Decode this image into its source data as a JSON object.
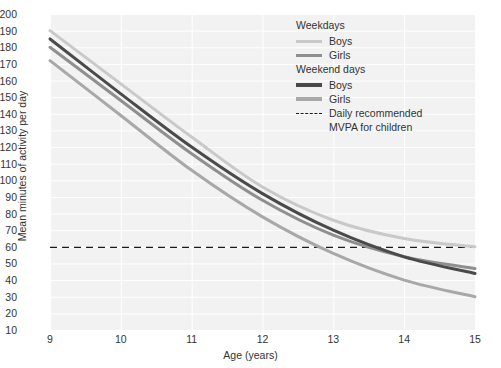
{
  "chart_data": {
    "type": "line",
    "title": "",
    "xlabel": "Age (years)",
    "ylabel": "Mean minutes of activity per day",
    "xlim": [
      9,
      15
    ],
    "ylim": [
      10,
      200
    ],
    "xticks": [
      "9",
      "10",
      "11",
      "12",
      "13",
      "14",
      "15"
    ],
    "yticks": [
      "200",
      "190",
      "180",
      "170",
      "160",
      "150",
      "140",
      "130",
      "120",
      "110",
      "100",
      "90",
      "80",
      "70",
      "60",
      "50",
      "40",
      "30",
      "20",
      "10"
    ],
    "grid": true,
    "legend_position": "upper right",
    "x": [
      9,
      10,
      11,
      12,
      13,
      14,
      15
    ],
    "series": [
      {
        "name": "Weekdays Boys",
        "group": "Weekdays",
        "sex": "Boys",
        "color": "#c9c9c9",
        "width": 3,
        "values": [
          190,
          158,
          126,
          96,
          76,
          65,
          60
        ]
      },
      {
        "name": "Weekdays Girls",
        "group": "Weekdays",
        "sex": "Girls",
        "color": "#8f8f8f",
        "width": 3,
        "values": [
          180,
          148,
          116,
          88,
          67,
          54,
          47
        ]
      },
      {
        "name": "Weekend days Boys",
        "group": "Weekend days",
        "sex": "Boys",
        "color": "#4a4a4a",
        "width": 3,
        "values": [
          185,
          152,
          120,
          92,
          70,
          54,
          44
        ]
      },
      {
        "name": "Weekend days Girls",
        "group": "Weekend days",
        "sex": "Girls",
        "color": "#a8a8a8",
        "width": 3,
        "values": [
          172,
          139,
          106,
          78,
          56,
          40,
          30
        ]
      }
    ],
    "reference_line": {
      "label": "Daily recommended MVPA for children",
      "value": 60,
      "style": "dashed",
      "color": "#1a1a1a"
    }
  },
  "legend": {
    "groups": [
      {
        "title": "Weekdays",
        "entries": [
          {
            "label": "Boys",
            "color": "#c9c9c9",
            "style": "thin"
          },
          {
            "label": "Girls",
            "color": "#8f8f8f",
            "style": "thin"
          }
        ]
      },
      {
        "title": "Weekend days",
        "entries": [
          {
            "label": "Boys",
            "color": "#4a4a4a",
            "style": "thick"
          },
          {
            "label": "Girls",
            "color": "#a8a8a8",
            "style": "thick"
          }
        ]
      }
    ],
    "reference": {
      "label_line1": "Daily recommended",
      "label_line2": "MVPA for children"
    }
  },
  "colors": {
    "plot_background": "#f2f2f2",
    "gridline": "#ffffff",
    "text": "#333333"
  }
}
